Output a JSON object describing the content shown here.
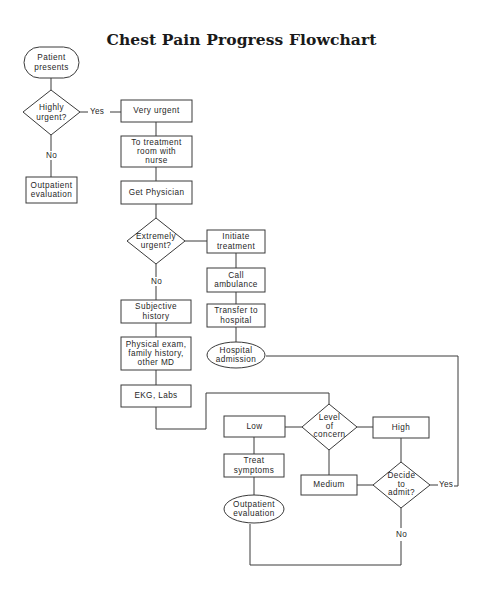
{
  "title": "Chest Pain Progress Flowchart",
  "colors": {
    "stroke": "#3a3a3a",
    "text": "#1f1f1f",
    "background": "#ffffff"
  },
  "nodes": {
    "patient_presents": {
      "type": "terminal",
      "label": "Patient\npresents"
    },
    "highly_urgent": {
      "type": "decision",
      "label": "Highly\nurgent?"
    },
    "outpatient_eval_1": {
      "type": "process",
      "label": "Outpatient\nevaluation"
    },
    "very_urgent": {
      "type": "process",
      "label": "Very urgent"
    },
    "treatment_room": {
      "type": "process",
      "label": "To treatment\nroom with\nnurse"
    },
    "get_physician": {
      "type": "process",
      "label": "Get Physician"
    },
    "extremely_urgent": {
      "type": "decision",
      "label": "Extremely\nurgent?"
    },
    "initiate_treatment": {
      "type": "process",
      "label": "Initiate\ntreatment"
    },
    "call_ambulance": {
      "type": "process",
      "label": "Call\nambulance"
    },
    "transfer_hospital": {
      "type": "process",
      "label": "Transfer to\nhospital"
    },
    "hospital_admission": {
      "type": "terminal",
      "label": "Hospital\nadmission"
    },
    "subjective_history": {
      "type": "process",
      "label": "Subjective\nhistory"
    },
    "physical_exam": {
      "type": "process",
      "label": "Physical exam,\nfamily history,\nother MD"
    },
    "ekg_labs": {
      "type": "process",
      "label": "EKG, Labs"
    },
    "level_of_concern": {
      "type": "decision",
      "label": "Level\nof\nconcern"
    },
    "low": {
      "type": "process",
      "label": "Low"
    },
    "high": {
      "type": "process",
      "label": "High"
    },
    "medium": {
      "type": "process",
      "label": "Medium"
    },
    "treat_symptoms": {
      "type": "process",
      "label": "Treat\nsymptoms"
    },
    "outpatient_eval_2": {
      "type": "terminal",
      "label": "Outpatient\nevaluation"
    },
    "decide_admit": {
      "type": "decision",
      "label": "Decide\nto\nadmit?"
    }
  },
  "edge_labels": {
    "highly_urgent_yes": "Yes",
    "highly_urgent_no": "No",
    "extremely_urgent_no": "No",
    "decide_admit_yes": "Yes",
    "decide_admit_no": "No"
  }
}
